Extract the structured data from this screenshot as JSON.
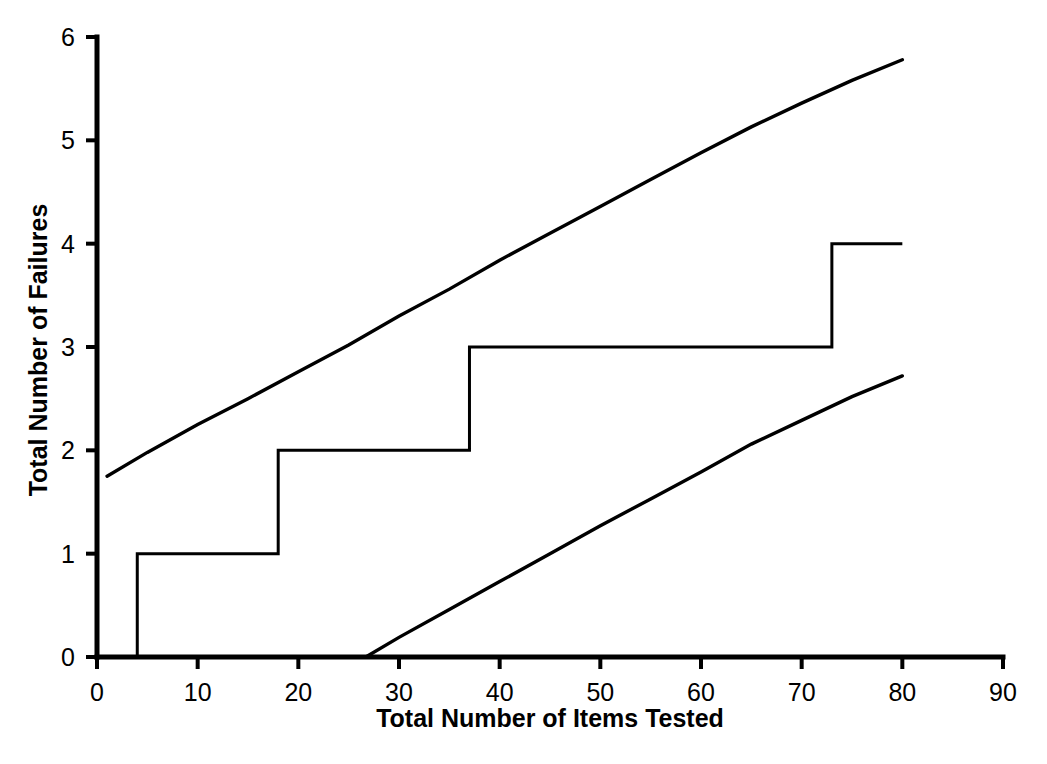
{
  "chart_data": {
    "type": "line",
    "title": "",
    "xlabel": "Total Number of Items Tested",
    "ylabel": "Total Number of Failures",
    "xlim": [
      0,
      90
    ],
    "ylim": [
      0,
      6
    ],
    "grid": false,
    "legend": "none",
    "x_ticks": [
      "0",
      "10",
      "20",
      "30",
      "40",
      "50",
      "60",
      "70",
      "80",
      "90"
    ],
    "y_ticks": [
      "0",
      "1",
      "2",
      "3",
      "4",
      "5",
      "6"
    ],
    "x_tick_values": [
      0,
      10,
      20,
      30,
      40,
      50,
      60,
      70,
      80,
      90
    ],
    "y_tick_values": [
      0,
      1,
      2,
      3,
      4,
      5,
      6
    ],
    "series": [
      {
        "name": "upper-confidence-bound",
        "style": "solid-line",
        "points": [
          [
            1.0,
            1.75
          ],
          [
            5.0,
            1.98
          ],
          [
            10.0,
            2.25
          ],
          [
            15.0,
            2.5
          ],
          [
            20.0,
            2.76
          ],
          [
            25.0,
            3.02
          ],
          [
            30.0,
            3.3
          ],
          [
            35.0,
            3.56
          ],
          [
            40.0,
            3.84
          ],
          [
            45.0,
            4.1
          ],
          [
            50.0,
            4.36
          ],
          [
            55.0,
            4.62
          ],
          [
            60.0,
            4.88
          ],
          [
            65.0,
            5.13
          ],
          [
            70.0,
            5.36
          ],
          [
            75.0,
            5.58
          ],
          [
            80.0,
            5.78
          ]
        ]
      },
      {
        "name": "cumulative-failures-step",
        "style": "step-post",
        "jumps": [
          {
            "x": 4.0,
            "to": 1
          },
          {
            "x": 18.0,
            "to": 2
          },
          {
            "x": 37.0,
            "to": 3
          },
          {
            "x": 73.0,
            "to": 4
          }
        ],
        "start": [
          4.0,
          0
        ],
        "end": [
          80.0,
          4
        ],
        "points": [
          [
            4.0,
            0
          ],
          [
            4.0,
            1
          ],
          [
            18.0,
            1
          ],
          [
            18.0,
            2
          ],
          [
            37.0,
            2
          ],
          [
            37.0,
            3
          ],
          [
            73.0,
            3
          ],
          [
            73.0,
            4
          ],
          [
            80.0,
            4
          ]
        ]
      },
      {
        "name": "lower-confidence-bound",
        "style": "solid-line",
        "points": [
          [
            26.7,
            0.0
          ],
          [
            30.0,
            0.19
          ],
          [
            35.0,
            0.46
          ],
          [
            40.0,
            0.73
          ],
          [
            45.0,
            1.0
          ],
          [
            50.0,
            1.27
          ],
          [
            55.0,
            1.53
          ],
          [
            60.0,
            1.79
          ],
          [
            65.0,
            2.06
          ],
          [
            70.0,
            2.29
          ],
          [
            75.0,
            2.52
          ],
          [
            80.0,
            2.72
          ]
        ]
      }
    ]
  },
  "axes": {
    "x_title": "Total Number of Items Tested",
    "y_title": "Total Number of Failures"
  },
  "colors": {
    "line": "#000000",
    "axis": "#000000",
    "background": "#ffffff"
  }
}
